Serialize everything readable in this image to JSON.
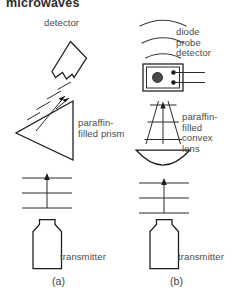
{
  "figure": {
    "banner_text": "microwaves",
    "panels": [
      {
        "id": "a",
        "caption": "(a)",
        "detector_label": "detector",
        "optic_label": "paraffin-\nfilled prism",
        "transmitter_label": "transmitter"
      },
      {
        "id": "b",
        "caption": "(b)",
        "detector_label": "diode\nprobe\ndetector",
        "optic_label": "paraffin-\nfilled\nconvex\nlens",
        "transmitter_label": "transmitter"
      }
    ],
    "colors": {
      "ink": "#1b1b1b",
      "text": "#4a4a4a",
      "background": "#ffffff",
      "dot_fill": "#4a4a4a"
    }
  }
}
